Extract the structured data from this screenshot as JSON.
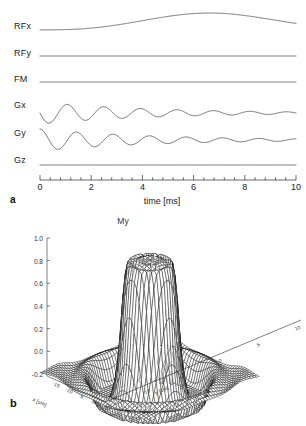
{
  "figure": {
    "panel_a_letter": "a",
    "panel_b_letter": "b"
  },
  "panel_a": {
    "channels": [
      {
        "name": "RFx",
        "label": "RFx",
        "type": "envelope"
      },
      {
        "name": "RFy",
        "label": "RFy",
        "type": "flat"
      },
      {
        "name": "FM",
        "label": "FM",
        "type": "flat"
      },
      {
        "name": "Gx",
        "label": "Gx",
        "type": "decaying-cosine"
      },
      {
        "name": "Gy",
        "label": "Gy",
        "type": "decaying-sine"
      },
      {
        "name": "Gz",
        "label": "Gz",
        "type": "flat"
      }
    ],
    "xlabel": "time [ms]",
    "xticks": [
      0,
      2,
      4,
      6,
      8,
      10
    ],
    "xtick_labels": [
      "0",
      "2",
      "4",
      "6",
      "8",
      "10"
    ],
    "xlim": [
      0,
      10
    ],
    "minor_ticks_per_interval": 4
  },
  "panel_b": {
    "title": "My",
    "zticks": [
      1.0,
      0.8,
      0.6,
      0.4,
      0.2,
      0.0,
      -0.2
    ],
    "ztick_labels": [
      "1.0",
      "0.8",
      "0.6",
      "0.4",
      "0.2",
      "0.0",
      "-0.2"
    ],
    "zlim": [
      -0.2,
      1.0
    ],
    "xlabel": "x [cm]",
    "ylabel": "y [cm]",
    "xticks": [
      -15,
      -10,
      -5,
      0,
      5
    ],
    "xtick_labels": [
      "-15",
      "-10",
      "-5",
      "0",
      "5"
    ],
    "yticks": [
      -15,
      -10,
      -5,
      0,
      5,
      10
    ],
    "ytick_labels": [
      "-15",
      "-10",
      "-5",
      "0",
      "5",
      "10"
    ],
    "xlim": [
      -18,
      8
    ],
    "ylim": [
      -18,
      12
    ]
  },
  "chart_data": [
    {
      "type": "line",
      "title": "",
      "panel": "a",
      "xlabel": "time [ms]",
      "ylabel": "",
      "xlim": [
        0,
        10
      ],
      "xticks": [
        0,
        2,
        4,
        6,
        8,
        10
      ],
      "grid": false,
      "legend": "left-axis-labels",
      "series": [
        {
          "name": "RFx",
          "description": "smooth broad RF amplitude envelope rising from baseline, peaking near t=6.5 ms then falling",
          "x": [
            0,
            0.5,
            1,
            1.5,
            2,
            2.5,
            3,
            3.5,
            4,
            4.5,
            5,
            5.5,
            6,
            6.5,
            7,
            7.5,
            8,
            8.5,
            9,
            9.5,
            10
          ],
          "values": [
            0.02,
            0.03,
            0.05,
            0.08,
            0.13,
            0.2,
            0.29,
            0.4,
            0.52,
            0.64,
            0.76,
            0.86,
            0.94,
            0.99,
            1.0,
            0.97,
            0.9,
            0.79,
            0.64,
            0.46,
            0.26
          ]
        },
        {
          "name": "RFy",
          "description": "zero throughout",
          "x": [
            0,
            2,
            4,
            6,
            8,
            10
          ],
          "values": [
            0,
            0,
            0,
            0,
            0,
            0
          ]
        },
        {
          "name": "FM",
          "description": "zero throughout (no frequency modulation)",
          "x": [
            0,
            2,
            4,
            6,
            8,
            10
          ],
          "values": [
            0,
            0,
            0,
            0,
            0,
            0
          ]
        },
        {
          "name": "Gx",
          "description": "oscillating gradient, approx 7 cycles over 10 ms, amplitude decaying to near zero",
          "x": [
            0,
            0.36,
            0.71,
            1.07,
            1.43,
            1.79,
            2.14,
            2.5,
            2.86,
            3.21,
            3.57,
            3.93,
            4.29,
            4.64,
            5,
            5.36,
            5.71,
            6.07,
            6.43,
            6.79,
            7.14,
            7.5,
            7.86,
            8.21,
            8.57,
            8.93,
            9.29,
            9.64,
            10
          ],
          "values": [
            0.0,
            -0.95,
            0.0,
            0.9,
            0.0,
            -0.82,
            0.0,
            0.74,
            0.0,
            -0.64,
            0.0,
            0.55,
            0.0,
            -0.46,
            0.0,
            0.37,
            0.0,
            -0.29,
            0.0,
            0.22,
            0.0,
            -0.16,
            0.0,
            0.11,
            0.0,
            -0.07,
            0.0,
            0.04,
            0.0
          ]
        },
        {
          "name": "Gy",
          "description": "oscillating gradient in quadrature with Gx (90 degrees phase shift), same decaying amplitude",
          "x": [
            0,
            0.36,
            0.71,
            1.07,
            1.43,
            1.79,
            2.14,
            2.5,
            2.86,
            3.21,
            3.57,
            3.93,
            4.29,
            4.64,
            5,
            5.36,
            5.71,
            6.07,
            6.43,
            6.79,
            7.14,
            7.5,
            7.86,
            8.21,
            8.57,
            8.93,
            9.29,
            9.64,
            10
          ],
          "values": [
            1.0,
            0.0,
            -0.93,
            0.0,
            0.86,
            0.0,
            -0.78,
            0.0,
            0.69,
            0.0,
            -0.6,
            0.0,
            0.51,
            0.0,
            -0.42,
            0.0,
            0.34,
            0.0,
            -0.26,
            0.0,
            0.19,
            0.0,
            -0.14,
            0.0,
            0.09,
            0.0,
            -0.05,
            0.0,
            0.02
          ]
        },
        {
          "name": "Gz",
          "description": "zero throughout",
          "x": [
            0,
            2,
            4,
            6,
            8,
            10
          ],
          "values": [
            0,
            0,
            0,
            0,
            0,
            0
          ]
        }
      ]
    },
    {
      "type": "surface",
      "panel": "b",
      "title": "My",
      "xlabel": "x [cm]",
      "ylabel": "y [cm]",
      "zlabel": "My",
      "zlim": [
        -0.2,
        1.0
      ],
      "xlim": [
        -18,
        8
      ],
      "ylim": [
        -18,
        12
      ],
      "description": "2D selective excitation profile: a steep-walled flat-topped cylindrical plateau at My=1.0 centered near the origin, surrounded by a negative ring undershoot reaching about -0.2 and small oscillatory side lobes",
      "plateau_value": 1.0,
      "undershoot_value": -0.2,
      "plateau_radius_cm": 5,
      "grid": true,
      "legend": "none"
    }
  ]
}
